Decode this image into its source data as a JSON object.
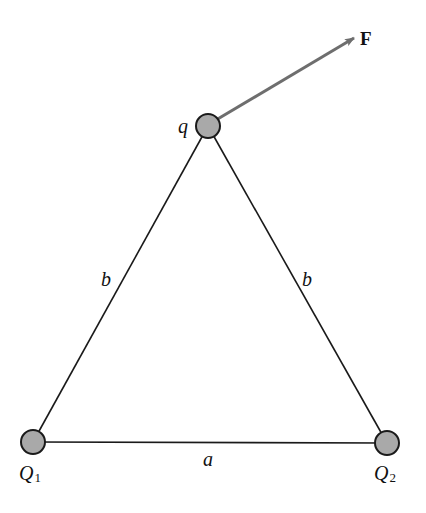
{
  "diagram": {
    "charges": [
      {
        "id": "q",
        "label": "q",
        "x": 208,
        "y": 126
      },
      {
        "id": "Q1",
        "label": "Q",
        "subscript": "1",
        "x": 33,
        "y": 442
      },
      {
        "id": "Q2",
        "label": "Q",
        "subscript": "2",
        "x": 387,
        "y": 443
      }
    ],
    "sides": [
      {
        "from": "q",
        "to": "Q1",
        "label": "b"
      },
      {
        "from": "q",
        "to": "Q2",
        "label": "b"
      },
      {
        "from": "Q1",
        "to": "Q2",
        "label": "a"
      }
    ],
    "force": {
      "label": "F",
      "from": "q",
      "direction": "up-right"
    },
    "colors": {
      "charge_fill": "#a9a9a9",
      "arrow": "#6e6e6e",
      "line": "#1a1a1a"
    }
  }
}
